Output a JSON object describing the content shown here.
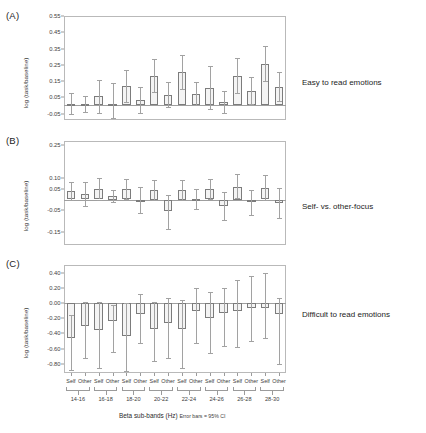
{
  "figure": {
    "y_axis_title": "log (task/baseline)",
    "x_axis_title": "Beta sub-bands (Hz)",
    "x_axis_note": "Error bars = 95% CI",
    "bar_fill": "#f4f4f4",
    "bar_stroke": "#7c7c7c",
    "error_color": "#a2a2a2"
  },
  "panels": [
    {
      "letter": "(A)",
      "side_label": "Easy to read emotions"
    },
    {
      "letter": "(B)",
      "side_label": "Self- vs. other-focus"
    },
    {
      "letter": "(C)",
      "side_label": "Difficult to read emotions"
    }
  ],
  "chart_data": [
    {
      "type": "bar",
      "title": "Easy to read emotions",
      "panel": "(A)",
      "xlabel": "Beta sub-bands (Hz)",
      "ylabel": "log (task/baseline)",
      "ylim": [
        -0.09,
        0.55
      ],
      "yticks": [
        0.55,
        0.45,
        0.35,
        0.25,
        0.15,
        0.05,
        -0.05
      ],
      "ytick_labels": [
        "0.55",
        "0.45",
        "0.35",
        "0.25",
        "0.15",
        "0.05",
        "-0.05"
      ],
      "grid": false,
      "legend": "none",
      "error_note": "Error bars = 95% CI",
      "bands": [
        "14-16",
        "16-18",
        "18-20",
        "20-22",
        "22-24",
        "24-26",
        "26-28",
        "28-30"
      ],
      "focus_levels": [
        "Self",
        "Other"
      ],
      "categories": [
        "14-16 Self",
        "14-16 Other",
        "16-18 Self",
        "16-18 Other",
        "18-20 Self",
        "18-20 Other",
        "20-22 Self",
        "20-22 Other",
        "22-24 Self",
        "22-24 Other",
        "24-26 Self",
        "24-26 Other",
        "26-28 Self",
        "26-28 Other",
        "28-30 Self",
        "28-30 Other"
      ],
      "values": [
        0.01,
        0.008,
        0.055,
        0.008,
        0.12,
        0.035,
        0.18,
        0.065,
        0.205,
        0.07,
        0.11,
        0.02,
        0.18,
        0.09,
        0.255,
        0.115
      ],
      "ci_low": [
        -0.055,
        -0.04,
        -0.045,
        -0.08,
        0.02,
        -0.045,
        0.08,
        -0.01,
        0.1,
        0.0,
        -0.02,
        -0.045,
        0.075,
        0.01,
        0.15,
        0.03
      ],
      "ci_high": [
        0.075,
        0.06,
        0.155,
        0.14,
        0.215,
        0.115,
        0.285,
        0.145,
        0.31,
        0.145,
        0.245,
        0.09,
        0.29,
        0.175,
        0.365,
        0.205
      ]
    },
    {
      "type": "bar",
      "title": "Self- vs. other-focus",
      "panel": "(B)",
      "xlabel": "Beta sub-bands (Hz)",
      "ylabel": "log (task/baseline)",
      "ylim": [
        -0.21,
        0.27
      ],
      "yticks": [
        0.25,
        0.1,
        0.05,
        -0.05,
        -0.15
      ],
      "ytick_labels": [
        "0.25",
        "0.10",
        "0.05",
        "-0.05",
        "-0.15"
      ],
      "grid": false,
      "legend": "none",
      "error_note": "Error bars = 95% CI",
      "bands": [
        "14-16",
        "16-18",
        "18-20",
        "20-22",
        "22-24",
        "24-26",
        "26-28",
        "28-30"
      ],
      "focus_levels": [
        "Self",
        "Other"
      ],
      "categories": [
        "14-16 Self",
        "14-16 Other",
        "16-18 Self",
        "16-18 Other",
        "18-20 Self",
        "18-20 Other",
        "20-22 Self",
        "20-22 Other",
        "22-24 Self",
        "22-24 Other",
        "24-26 Self",
        "24-26 Other",
        "26-28 Self",
        "26-28 Other",
        "28-30 Self",
        "28-30 Other"
      ],
      "values": [
        0.04,
        0.025,
        0.05,
        0.015,
        0.048,
        0.0,
        0.045,
        -0.055,
        0.045,
        0.002,
        0.05,
        -0.03,
        0.06,
        -0.012,
        0.055,
        -0.015
      ],
      "ci_low": [
        -0.002,
        -0.03,
        0.0,
        -0.012,
        0.002,
        -0.06,
        0.0,
        -0.135,
        -0.002,
        -0.045,
        0.002,
        -0.095,
        0.005,
        -0.07,
        -0.002,
        -0.085
      ],
      "ci_high": [
        0.082,
        0.08,
        0.1,
        0.042,
        0.095,
        0.06,
        0.09,
        0.022,
        0.092,
        0.048,
        0.095,
        0.035,
        0.118,
        0.045,
        0.112,
        0.055
      ]
    },
    {
      "type": "bar",
      "title": "Difficult to read emotions",
      "panel": "(C)",
      "xlabel": "Beta sub-bands (Hz)",
      "ylabel": "log (task/baseline)",
      "ylim": [
        -0.92,
        0.5
      ],
      "yticks": [
        0.4,
        0.2,
        0.0,
        -0.2,
        -0.4,
        -0.6,
        -0.8
      ],
      "ytick_labels": [
        "0.40",
        "0.20",
        "0.00",
        "-0.20",
        "-0.40",
        "-0.60",
        "-0.80"
      ],
      "grid": false,
      "legend": "none",
      "error_note": "Error bars = 95% CI",
      "bands": [
        "14-16",
        "16-18",
        "18-20",
        "20-22",
        "22-24",
        "24-26",
        "26-28",
        "28-30"
      ],
      "focus_levels": [
        "Self",
        "Other"
      ],
      "categories": [
        "14-16 Self",
        "14-16 Other",
        "16-18 Self",
        "16-18 Other",
        "18-20 Self",
        "18-20 Other",
        "20-22 Self",
        "20-22 Other",
        "22-24 Self",
        "22-24 Other",
        "24-26 Self",
        "24-26 Other",
        "26-28 Self",
        "26-28 Other",
        "28-30 Self",
        "28-30 Other"
      ],
      "values": [
        -0.46,
        -0.3,
        -0.36,
        -0.24,
        -0.44,
        -0.14,
        -0.34,
        -0.26,
        -0.34,
        -0.1,
        -0.2,
        -0.13,
        -0.1,
        -0.06,
        -0.06,
        -0.14
      ],
      "ci_low": [
        -0.88,
        -0.72,
        -0.86,
        -0.64,
        -0.9,
        -0.52,
        -0.76,
        -0.72,
        -0.86,
        -0.52,
        -0.66,
        -0.56,
        -0.58,
        -0.5,
        -0.46,
        -0.8
      ],
      "ci_high": [
        -0.16,
        0.02,
        0.02,
        -0.02,
        0.0,
        0.12,
        0.02,
        0.06,
        0.04,
        0.2,
        0.14,
        0.2,
        0.3,
        0.36,
        0.4,
        0.06
      ]
    }
  ]
}
